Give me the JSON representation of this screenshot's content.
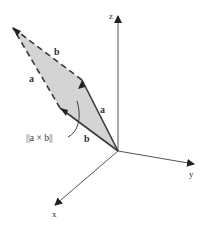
{
  "diagram": {
    "axes": {
      "x_label": "x",
      "y_label": "y",
      "z_label": "z"
    },
    "vectors": {
      "a_label": "a",
      "b_label": "b",
      "a_dashed_label": "a",
      "b_dashed_label": "b"
    },
    "annotation": {
      "text": "||a × b||"
    },
    "colors": {
      "fill": "#d4d4d4",
      "stroke": "#3a3a3a",
      "axis": "#555555"
    }
  }
}
